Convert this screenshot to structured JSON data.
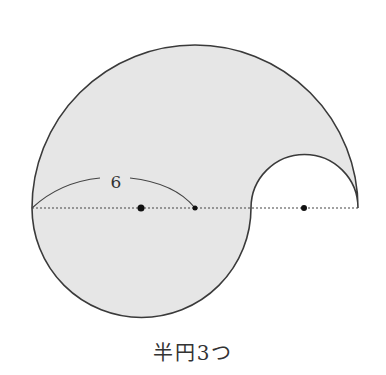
{
  "figure": {
    "label_length": "6",
    "caption": "半円3つ",
    "colors": {
      "fill": "#e6e6e6",
      "stroke": "#3a3a3a",
      "dots": "#111111"
    },
    "geometry": {
      "baseline_y": 208,
      "large_semicircle": {
        "cx": 195,
        "r": 163,
        "side": "upper"
      },
      "lower_semicircle": {
        "cx": 141.5,
        "r": 109.5,
        "side": "lower"
      },
      "small_semicircle": {
        "cx": 304.5,
        "r": 53.5,
        "side": "upper-cutout"
      },
      "center_dots_x": [
        141,
        195,
        304
      ]
    }
  }
}
